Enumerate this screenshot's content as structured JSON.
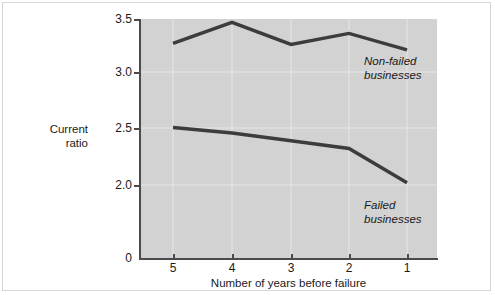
{
  "chart_data": {
    "type": "line",
    "title": "",
    "xlabel": "Number of years before failure",
    "ylabel": "Current\nratio",
    "ylabel_line1": "Current",
    "ylabel_line2": "ratio",
    "categories": [
      "5",
      "4",
      "3",
      "2",
      "1"
    ],
    "x_tick_labels": [
      "5",
      "4",
      "3",
      "2",
      "1"
    ],
    "y_tick_labels": [
      "3.5",
      "3.0",
      "2.5",
      "2.0",
      "0"
    ],
    "y_tick_values": [
      3.5,
      3.0,
      2.5,
      2.0,
      0
    ],
    "ylim": [
      0,
      3.5
    ],
    "y_axis_break": true,
    "grid": true,
    "legend": "annotations-inline",
    "plot_background": "#d2d2d2",
    "line_color": "#3c3c3c",
    "grid_color": "#e8e8e8",
    "axis_color": "#4a4a4a",
    "series": [
      {
        "name": "Non-failed businesses",
        "values": [
          3.28,
          3.47,
          3.27,
          3.37,
          3.22
        ],
        "annotation_line1": "Non-failed",
        "annotation_line2": "businesses"
      },
      {
        "name": "Failed businesses",
        "values": [
          2.52,
          2.47,
          2.4,
          2.33,
          2.02
        ],
        "annotation_line1": "Failed",
        "annotation_line2": "businesses"
      }
    ]
  },
  "annotations": {
    "nonfailed": "Non-failed\nbusinesses",
    "failed": "Failed\nbusinesses"
  },
  "axes": {
    "x_title": "Number of years before failure",
    "y_title_line1": "Current",
    "y_title_line2": "ratio"
  }
}
